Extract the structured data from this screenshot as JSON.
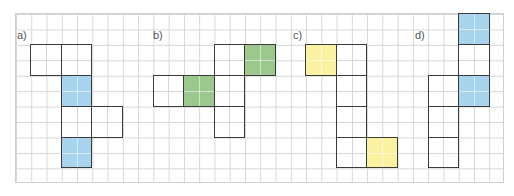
{
  "grid": {
    "columns": 32,
    "rows": 11,
    "cell_w": 15.28,
    "cell_h": 15.45,
    "left": 15,
    "top": 13,
    "line_color": "#d6d6d6"
  },
  "colors": {
    "blue": "#a8d4f0",
    "green": "#9bc88c",
    "yellow": "#faf2a0",
    "white": "#ffffff",
    "outline": "#3a3a3a"
  },
  "figures": [
    {
      "label": "a)",
      "label_pos": [
        17,
        29
      ],
      "squares": [
        {
          "col": 1,
          "row": 2,
          "fill": "white"
        },
        {
          "col": 3,
          "row": 2,
          "fill": "white"
        },
        {
          "col": 3,
          "row": 4,
          "fill": "blue"
        },
        {
          "col": 3,
          "row": 6,
          "fill": "white"
        },
        {
          "col": 5,
          "row": 6,
          "fill": "white"
        },
        {
          "col": 3,
          "row": 8,
          "fill": "blue"
        }
      ]
    },
    {
      "label": "b)",
      "label_pos": [
        153,
        29
      ],
      "squares": [
        {
          "col": 9,
          "row": 4,
          "fill": "white"
        },
        {
          "col": 11,
          "row": 4,
          "fill": "green"
        },
        {
          "col": 13,
          "row": 2,
          "fill": "white"
        },
        {
          "col": 15,
          "row": 2,
          "fill": "green"
        },
        {
          "col": 13,
          "row": 4,
          "fill": "white"
        },
        {
          "col": 13,
          "row": 6,
          "fill": "white"
        }
      ]
    },
    {
      "label": "c)",
      "label_pos": [
        293,
        29
      ],
      "squares": [
        {
          "col": 19,
          "row": 2,
          "fill": "yellow"
        },
        {
          "col": 21,
          "row": 2,
          "fill": "white"
        },
        {
          "col": 21,
          "row": 4,
          "fill": "white"
        },
        {
          "col": 21,
          "row": 6,
          "fill": "white"
        },
        {
          "col": 21,
          "row": 8,
          "fill": "white"
        },
        {
          "col": 23,
          "row": 8,
          "fill": "yellow"
        }
      ]
    },
    {
      "label": "d)",
      "label_pos": [
        415,
        29
      ],
      "squares": [
        {
          "col": 29,
          "row": 0,
          "fill": "blue"
        },
        {
          "col": 29,
          "row": 2,
          "fill": "white"
        },
        {
          "col": 29,
          "row": 4,
          "fill": "blue"
        },
        {
          "col": 27,
          "row": 4,
          "fill": "white"
        },
        {
          "col": 27,
          "row": 6,
          "fill": "white"
        },
        {
          "col": 27,
          "row": 8,
          "fill": "white"
        }
      ]
    }
  ]
}
